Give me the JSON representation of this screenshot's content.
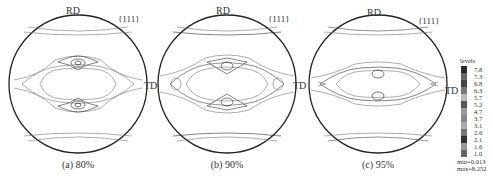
{
  "figure": {
    "panels": [
      {
        "id": "a",
        "caption": "(a) 80%",
        "rd_label": "RD",
        "td_label": "TD",
        "plane_label": "{111}",
        "cx": 78,
        "cy": 84
      },
      {
        "id": "b",
        "caption": "(b) 90%",
        "rd_label": "RD",
        "td_label": "TD",
        "plane_label": "{111}",
        "cx": 227,
        "cy": 84
      },
      {
        "id": "c",
        "caption": "(c) 95%",
        "rd_label": "RD",
        "td_label": "TD",
        "plane_label": "{111}",
        "cx": 378,
        "cy": 84
      }
    ],
    "legend": {
      "title": "levels",
      "levels": [
        "7.8",
        "7.3",
        "6.8",
        "6.3",
        "5.7",
        "5.2",
        "4.7",
        "3.7",
        "3.1",
        "2.6",
        "2.1",
        "1.6",
        "1.0"
      ],
      "colors": [
        "#2a2a2a",
        "#666",
        "#444",
        "#777",
        "#bbb",
        "#555",
        "#999",
        "#888",
        "#aaa",
        "#777",
        "#333",
        "#999",
        "#666"
      ],
      "min_label": "min=0.013",
      "max_label": "max=8.252"
    }
  }
}
